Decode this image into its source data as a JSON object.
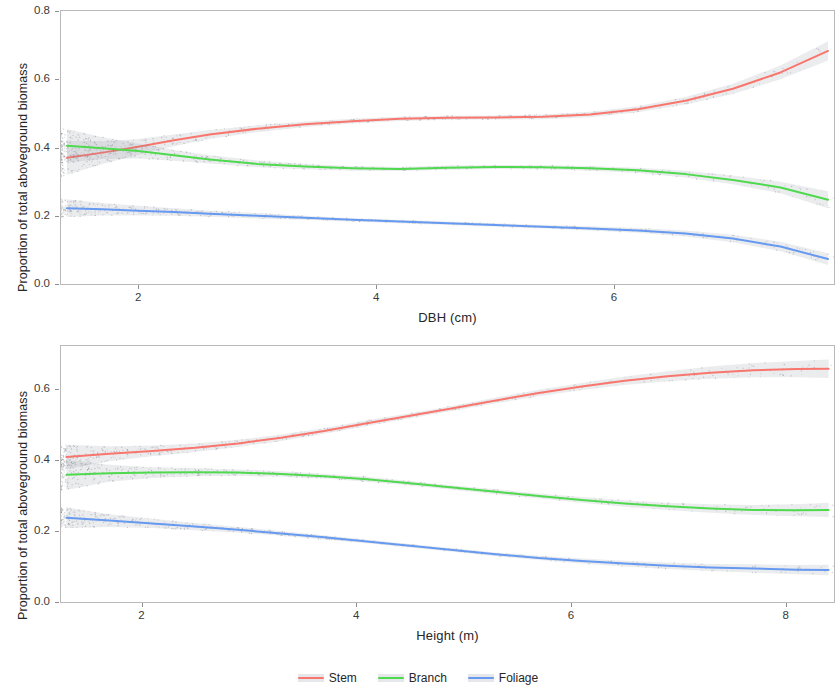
{
  "figure": {
    "background": "#ffffff",
    "panel_border": "#b9b9b9"
  },
  "legend": {
    "position": "bottom",
    "items": [
      {
        "label": "Stem",
        "color": "#F8766D"
      },
      {
        "label": "Branch",
        "color": "#4FD94F"
      },
      {
        "label": "Foliage",
        "color": "#6699F0"
      }
    ]
  },
  "chart_data": [
    {
      "id": "panel-dbh",
      "type": "line",
      "title": "",
      "xlabel": "DBH (cm)",
      "ylabel": "Proportion of total aboveground biomass",
      "xlim": [
        1.35,
        7.85
      ],
      "ylim": [
        0.0,
        0.8
      ],
      "xticks": [
        2,
        4,
        6,
        8
      ],
      "xtick_labels": [
        "2",
        "4",
        "6",
        "8"
      ],
      "yticks": [
        0.0,
        0.2,
        0.4,
        0.6,
        0.8
      ],
      "ytick_labels": [
        "0.0",
        "0.2",
        "0.4",
        "0.6",
        "0.8"
      ],
      "grid": false,
      "legend_position": "bottom",
      "x": [
        1.4,
        1.7,
        2.0,
        2.3,
        2.6,
        3.0,
        3.4,
        3.8,
        4.2,
        4.6,
        5.0,
        5.4,
        5.8,
        6.2,
        6.6,
        7.0,
        7.4,
        7.8
      ],
      "series": [
        {
          "name": "Stem",
          "color": "#F8766D",
          "values": [
            0.37,
            0.385,
            0.402,
            0.421,
            0.438,
            0.455,
            0.468,
            0.477,
            0.484,
            0.487,
            0.488,
            0.49,
            0.497,
            0.512,
            0.537,
            0.572,
            0.62,
            0.683
          ],
          "ci_lower": [
            0.32,
            0.352,
            0.379,
            0.404,
            0.425,
            0.445,
            0.46,
            0.47,
            0.478,
            0.481,
            0.482,
            0.483,
            0.489,
            0.503,
            0.526,
            0.557,
            0.6,
            0.655
          ],
          "ci_upper": [
            0.42,
            0.418,
            0.425,
            0.438,
            0.451,
            0.465,
            0.476,
            0.484,
            0.49,
            0.493,
            0.494,
            0.497,
            0.505,
            0.521,
            0.548,
            0.587,
            0.64,
            0.711
          ]
        },
        {
          "name": "Branch",
          "color": "#4FD94F",
          "values": [
            0.405,
            0.398,
            0.39,
            0.377,
            0.365,
            0.352,
            0.344,
            0.339,
            0.337,
            0.341,
            0.343,
            0.342,
            0.339,
            0.333,
            0.322,
            0.305,
            0.283,
            0.247
          ],
          "ci_lower": [
            0.356,
            0.366,
            0.368,
            0.361,
            0.353,
            0.342,
            0.336,
            0.332,
            0.331,
            0.335,
            0.337,
            0.336,
            0.332,
            0.325,
            0.312,
            0.292,
            0.266,
            0.222
          ],
          "ci_upper": [
            0.454,
            0.43,
            0.412,
            0.393,
            0.377,
            0.362,
            0.352,
            0.346,
            0.343,
            0.347,
            0.349,
            0.348,
            0.346,
            0.341,
            0.332,
            0.318,
            0.3,
            0.272
          ]
        },
        {
          "name": "Foliage",
          "color": "#6699F0",
          "values": [
            0.222,
            0.219,
            0.215,
            0.211,
            0.206,
            0.2,
            0.194,
            0.188,
            0.183,
            0.178,
            0.173,
            0.168,
            0.163,
            0.157,
            0.148,
            0.133,
            0.11,
            0.073
          ],
          "ci_lower": [
            0.196,
            0.201,
            0.201,
            0.2,
            0.197,
            0.192,
            0.188,
            0.183,
            0.178,
            0.173,
            0.168,
            0.163,
            0.157,
            0.15,
            0.139,
            0.122,
            0.096,
            0.056
          ],
          "ci_upper": [
            0.248,
            0.237,
            0.229,
            0.222,
            0.215,
            0.208,
            0.2,
            0.193,
            0.188,
            0.183,
            0.178,
            0.173,
            0.169,
            0.164,
            0.157,
            0.144,
            0.124,
            0.09
          ]
        }
      ]
    },
    {
      "id": "panel-height",
      "type": "line",
      "title": "",
      "xlabel": "Height (m)",
      "ylabel": "Proportion of total aboveground biomass",
      "xlim": [
        1.25,
        8.45
      ],
      "ylim": [
        0.0,
        0.72
      ],
      "xticks": [
        2,
        4,
        6,
        8
      ],
      "xtick_labels": [
        "2",
        "4",
        "6",
        "8"
      ],
      "yticks": [
        0.0,
        0.2,
        0.4,
        0.6
      ],
      "ytick_labels": [
        "0.0",
        "0.2",
        "0.4",
        "0.6"
      ],
      "grid": false,
      "legend_position": "bottom",
      "x": [
        1.3,
        1.7,
        2.1,
        2.5,
        2.9,
        3.3,
        3.7,
        4.1,
        4.5,
        4.9,
        5.3,
        5.7,
        6.1,
        6.5,
        6.9,
        7.3,
        7.7,
        8.1,
        8.4
      ],
      "series": [
        {
          "name": "Stem",
          "color": "#F8766D",
          "values": [
            0.408,
            0.417,
            0.425,
            0.434,
            0.446,
            0.462,
            0.481,
            0.503,
            0.524,
            0.545,
            0.567,
            0.588,
            0.606,
            0.622,
            0.635,
            0.645,
            0.652,
            0.655,
            0.656
          ],
          "ci_lower": [
            0.374,
            0.396,
            0.41,
            0.422,
            0.436,
            0.453,
            0.473,
            0.495,
            0.517,
            0.538,
            0.559,
            0.579,
            0.596,
            0.61,
            0.621,
            0.628,
            0.632,
            0.632,
            0.63
          ],
          "ci_upper": [
            0.442,
            0.438,
            0.44,
            0.446,
            0.456,
            0.471,
            0.489,
            0.511,
            0.531,
            0.552,
            0.575,
            0.597,
            0.616,
            0.634,
            0.649,
            0.662,
            0.672,
            0.678,
            0.682
          ]
        },
        {
          "name": "Branch",
          "color": "#4FD94F",
          "values": [
            0.358,
            0.362,
            0.364,
            0.365,
            0.364,
            0.36,
            0.354,
            0.345,
            0.334,
            0.322,
            0.31,
            0.298,
            0.287,
            0.277,
            0.269,
            0.263,
            0.259,
            0.258,
            0.259
          ],
          "ci_lower": [
            0.315,
            0.338,
            0.349,
            0.354,
            0.355,
            0.352,
            0.347,
            0.338,
            0.328,
            0.316,
            0.303,
            0.291,
            0.279,
            0.268,
            0.259,
            0.251,
            0.245,
            0.241,
            0.239
          ],
          "ci_upper": [
            0.401,
            0.386,
            0.379,
            0.376,
            0.373,
            0.368,
            0.361,
            0.352,
            0.34,
            0.328,
            0.317,
            0.305,
            0.295,
            0.286,
            0.279,
            0.275,
            0.273,
            0.275,
            0.279
          ]
        },
        {
          "name": "Foliage",
          "color": "#6699F0",
          "values": [
            0.237,
            0.229,
            0.221,
            0.212,
            0.203,
            0.193,
            0.182,
            0.17,
            0.158,
            0.146,
            0.134,
            0.124,
            0.115,
            0.108,
            0.102,
            0.097,
            0.094,
            0.091,
            0.09
          ],
          "ci_lower": [
            0.208,
            0.211,
            0.208,
            0.202,
            0.195,
            0.186,
            0.176,
            0.165,
            0.153,
            0.141,
            0.129,
            0.118,
            0.108,
            0.1,
            0.093,
            0.087,
            0.082,
            0.078,
            0.075
          ],
          "ci_upper": [
            0.266,
            0.247,
            0.234,
            0.222,
            0.211,
            0.2,
            0.188,
            0.175,
            0.163,
            0.151,
            0.139,
            0.13,
            0.122,
            0.116,
            0.111,
            0.107,
            0.106,
            0.104,
            0.105
          ]
        }
      ]
    }
  ]
}
